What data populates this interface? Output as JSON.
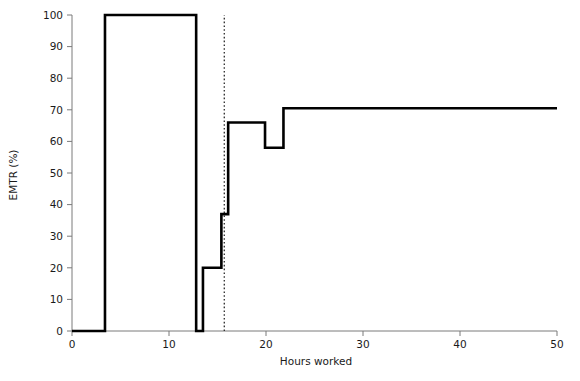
{
  "chart_data": {
    "type": "line",
    "title": "",
    "subtitle": "",
    "xlabel": "Hours worked",
    "ylabel": "EMTR (%)",
    "xlim": [
      0,
      50
    ],
    "ylim": [
      0,
      100
    ],
    "xticks": [
      0,
      10,
      20,
      30,
      40,
      50
    ],
    "xtick_labels": [
      "0",
      "10",
      "20",
      "30",
      "40",
      "50"
    ],
    "yticks": [
      0,
      10,
      20,
      30,
      40,
      50,
      60,
      70,
      80,
      90,
      100
    ],
    "ytick_labels": [
      "0",
      "10",
      "20",
      "30",
      "40",
      "50",
      "60",
      "70",
      "80",
      "90",
      "100"
    ],
    "grid": false,
    "legend": null,
    "line_color": "#000000",
    "axis_color": "#7a7a7a",
    "step_style": "post",
    "series": [
      {
        "name": "EMTR",
        "x": [
          0,
          3.4,
          3.4,
          12.8,
          12.8,
          13.5,
          13.5,
          15.4,
          15.4,
          16.1,
          16.1,
          19.9,
          19.9,
          21.8,
          21.8,
          50
        ],
        "values": [
          0,
          0,
          100,
          100,
          0,
          0,
          20,
          20,
          37,
          37,
          66,
          66,
          58,
          58,
          70.5,
          70.5
        ]
      }
    ],
    "annotations": [
      {
        "name": "reference-line",
        "type": "vline",
        "x": 15.7,
        "style": "dotted",
        "color": "#2b2b2b",
        "label": ""
      }
    ]
  },
  "axes": {
    "x_title": "Hours worked",
    "y_title": "EMTR (%)"
  }
}
